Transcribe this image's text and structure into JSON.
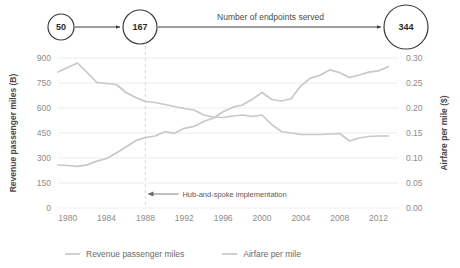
{
  "flow": {
    "label": "Number of endpoints served",
    "nodes": [
      {
        "name": "node-start",
        "value": "50",
        "cx": 61,
        "cy": 27,
        "r": 13
      },
      {
        "name": "node-mid",
        "value": "167",
        "cx": 140,
        "cy": 27,
        "r": 17
      },
      {
        "name": "node-end",
        "value": "344",
        "cx": 406,
        "cy": 27,
        "r": 22
      }
    ]
  },
  "annotation": {
    "text": "Hub-and-spoke implementation",
    "marker_year": 1988
  },
  "legend": {
    "position": "bottom",
    "items": [
      {
        "label": "Revenue passenger miles",
        "color": "#c8c8c8"
      },
      {
        "label": "Airfare per mile",
        "color": "#c8c8c8"
      }
    ]
  },
  "chart_data": {
    "type": "line",
    "title": "",
    "subtitle": "",
    "xlabel": "",
    "ylabel": "Revenue passenger miles (B)",
    "y2label": "Airfare per mile ($)",
    "grid": true,
    "xlim": [
      1979,
      2014
    ],
    "ylim": [
      0,
      900
    ],
    "y2lim": [
      0.0,
      0.3
    ],
    "yticks": [
      0,
      150,
      300,
      450,
      600,
      750,
      900
    ],
    "yticklabels": [
      "0",
      "150",
      "300",
      "450",
      "600",
      "750",
      "900"
    ],
    "y2ticks": [
      0.0,
      0.05,
      0.1,
      0.15,
      0.2,
      0.25,
      0.3
    ],
    "y2ticklabels": [
      "0.00",
      "0.05",
      "0.10",
      "0.15",
      "0.20",
      "0.25",
      "0.30"
    ],
    "xticks": [
      1980,
      1984,
      1988,
      1992,
      1996,
      2000,
      2004,
      2008,
      2012
    ],
    "xticklabels": [
      "1980",
      "1984",
      "1988",
      "1992",
      "1996",
      "2000",
      "2004",
      "2008",
      "2012"
    ],
    "x": [
      1979,
      1980,
      1981,
      1982,
      1983,
      1984,
      1985,
      1986,
      1987,
      1988,
      1989,
      1990,
      1991,
      1992,
      1993,
      1994,
      1995,
      1996,
      1997,
      1998,
      1999,
      2000,
      2001,
      2002,
      2003,
      2004,
      2005,
      2006,
      2007,
      2008,
      2009,
      2010,
      2011,
      2012,
      2013
    ],
    "series": [
      {
        "name": "Revenue passenger miles",
        "axis": "left",
        "color": "#c8c8c8",
        "units": "B",
        "values": [
          258,
          255,
          250,
          259,
          281,
          297,
          330,
          366,
          404,
          423,
          432,
          458,
          448,
          478,
          489,
          519,
          540,
          578,
          605,
          618,
          652,
          693,
          651,
          642,
          656,
          733,
          779,
          797,
          829,
          812,
          783,
          798,
          815,
          823,
          848
        ]
      },
      {
        "name": "Airfare per mile",
        "axis": "right",
        "color": "#c8c8c8",
        "units": "$",
        "values": [
          0.272,
          0.281,
          0.29,
          0.271,
          0.251,
          0.249,
          0.247,
          0.231,
          0.221,
          0.213,
          0.211,
          0.207,
          0.203,
          0.199,
          0.196,
          0.186,
          0.182,
          0.181,
          0.184,
          0.186,
          0.183,
          0.186,
          0.167,
          0.153,
          0.15,
          0.147,
          0.147,
          0.147,
          0.148,
          0.149,
          0.134,
          0.14,
          0.143,
          0.144,
          0.144
        ]
      }
    ]
  }
}
